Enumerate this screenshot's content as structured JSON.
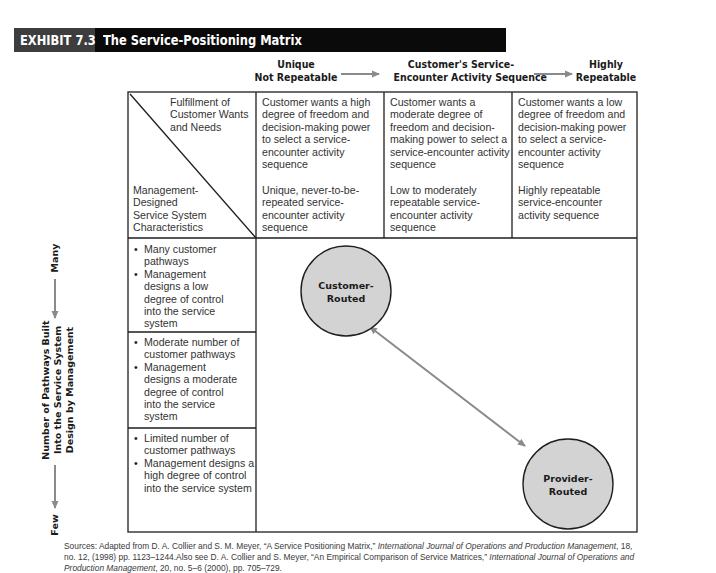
{
  "exhibit": {
    "number": "EXHIBIT 7.3",
    "title": "The Service-Positioning Matrix"
  },
  "top_axis": {
    "left_label": [
      "Unique",
      "Not Repeatable"
    ],
    "middle_label": [
      "Customer's Service-",
      "Encounter Activity Sequence"
    ],
    "right_label": [
      "Highly",
      "Repeatable"
    ],
    "arrow_color": "#8a8a8a"
  },
  "corner_cell": {
    "top_right_text": "Fulfillment of Customer Wants and Needs",
    "bottom_left_text": "Management-Designed Service System Characteristics"
  },
  "columns": [
    {
      "wants": "Customer wants a high degree of freedom and decision-making power to select a service-encounter activity sequence",
      "characteristics": "Unique, never-to-be-repeated service-encounter activity sequence"
    },
    {
      "wants": "Customer wants a moderate degree of freedom and decision-making power to select a service-encounter activity sequence",
      "characteristics": "Low to moderately repeatable service-encounter activity sequence"
    },
    {
      "wants": "Customer wants a low degree of freedom and decision-making power to select a service-encounter activity sequence",
      "characteristics": "Highly repeatable service-encounter activity sequence"
    }
  ],
  "rows": [
    {
      "bullets": [
        "Many customer pathways",
        "Management designs a low degree of control into the service system"
      ]
    },
    {
      "bullets": [
        "Moderate number of customer pathways",
        "Management designs a moderate degree of control into the service system"
      ]
    },
    {
      "bullets": [
        "Limited number of customer pathways",
        "Management designs a high degree of control into the service system"
      ]
    }
  ],
  "side_axis": {
    "top_label": "Many",
    "bottom_label": "Few",
    "title_lines": [
      "Number of Pathways Built",
      "Into the Service System",
      "Design by Management"
    ]
  },
  "nodes": {
    "customer_routed": [
      "Customer-",
      "Routed"
    ],
    "provider_routed": [
      "Provider-",
      "Routed"
    ],
    "fill_color": "#d3d3d3",
    "connector_color": "#8a8a8a"
  },
  "source": {
    "line1_prefix": "Sources: Adapted from D. A. Collier and S. M. Meyer, “A Service Positioning Matrix,” ",
    "line1_journal": "International Journal of Operations and Production Management",
    "line1_suffix": ", 18,",
    "line2_prefix": "no. 12, (1998) pp. 1123–1244.Also see D. A. Collier and S. Meyer, “An Empirical Comparison of Service Matrices,” ",
    "line2_journal": "International Journal of Operations and",
    "line3_journal": "Production Management",
    "line3_suffix": ", 20, no. 5–6 (2000), pp. 705–729."
  }
}
